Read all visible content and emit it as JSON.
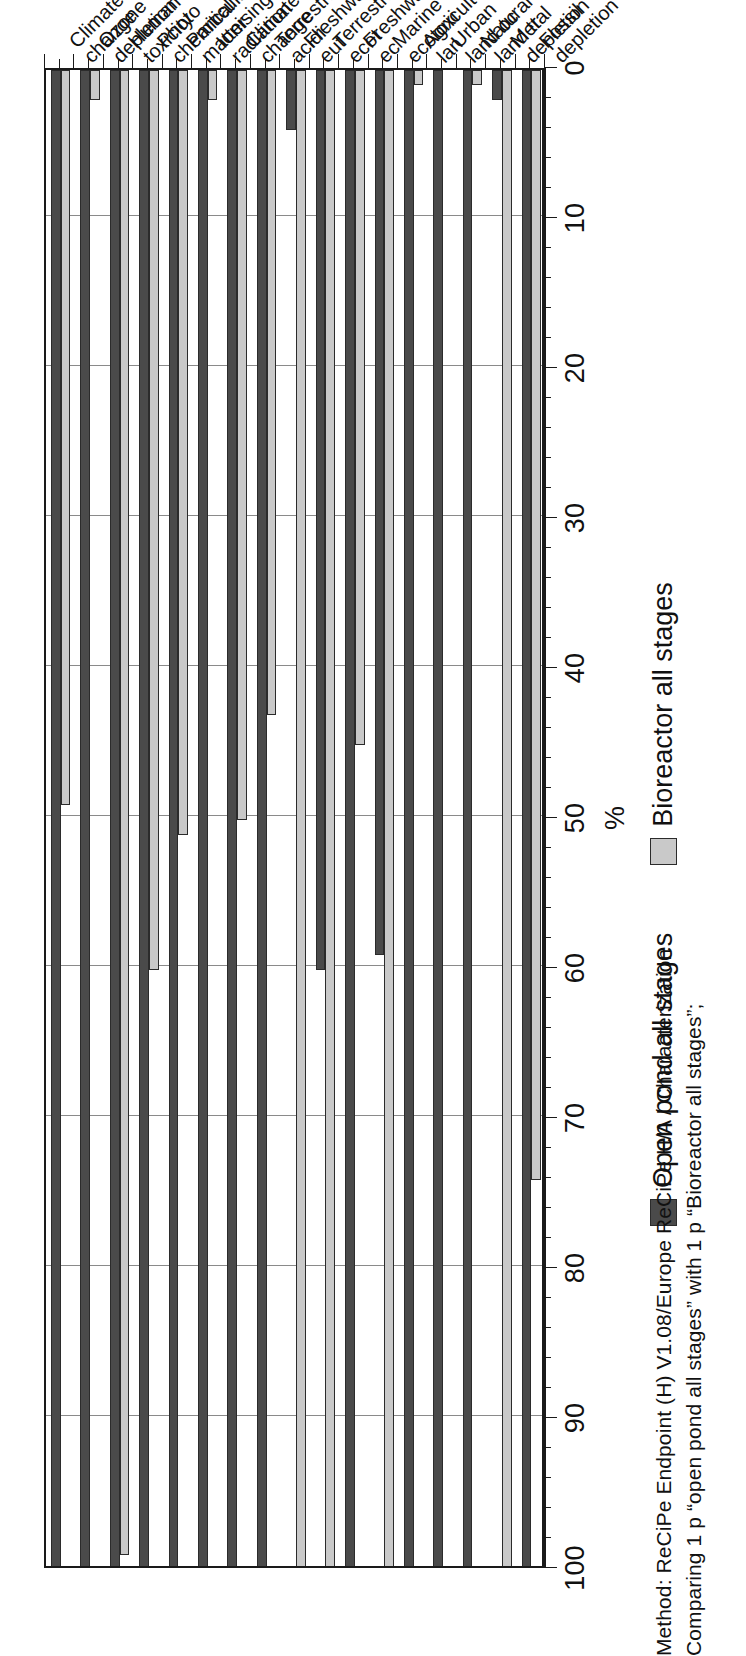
{
  "chart_data": {
    "type": "bar",
    "orientation": "horizontal-rotated",
    "title": "",
    "xlabel": "",
    "ylabel": "%",
    "value_axis_label": "%",
    "ylim": [
      0,
      100
    ],
    "axis_direction": "100-at-left-to-0-at-right",
    "grid": true,
    "legend_position": "bottom-center",
    "tick_values": [
      100,
      90,
      80,
      70,
      60,
      50,
      40,
      30,
      20,
      10,
      0
    ],
    "tick_labels": [
      "100",
      "90",
      "80",
      "70",
      "60",
      "50",
      "40",
      "30",
      "20",
      "10",
      "0"
    ],
    "minor_ticks_per_interval": 5,
    "categories": [
      {
        "line1": "Climate",
        "line2": "change"
      },
      {
        "line1": "Ozone",
        "line2": "depletion"
      },
      {
        "line1": "Human",
        "line2": "toxicity"
      },
      {
        "line1": "Photo",
        "line2": "chemical"
      },
      {
        "line1": "Particulate",
        "line2": "matter"
      },
      {
        "line1": "Ionising",
        "line2": "radiation"
      },
      {
        "line1": "Climate",
        "line2": "change"
      },
      {
        "line1": "Terrestrial",
        "line2": "acidi"
      },
      {
        "line1": "Freshwater",
        "line2": "eut"
      },
      {
        "line1": "Terrestrial",
        "line2": "ecot"
      },
      {
        "line1": "Freshwater",
        "line2": "ec"
      },
      {
        "line1": "Marine",
        "line2": "ecotoxi"
      },
      {
        "line1": "Agricultural",
        "line2": "lan"
      },
      {
        "line1": "Urban",
        "line2": "land oc"
      },
      {
        "line1": "Natural",
        "line2": "land tr"
      },
      {
        "line1": "Metal",
        "line2": "depletion"
      },
      {
        "line1": "Fossil",
        "line2": "depletion"
      }
    ],
    "series": [
      {
        "name": "Open pond all stages",
        "color": "#4a4a4a",
        "values": [
          100,
          100,
          100,
          100,
          100,
          100,
          100,
          100,
          4,
          60,
          100,
          59,
          100,
          100,
          100,
          2,
          100
        ]
      },
      {
        "name": "Bioreactor all stages",
        "color": "#c9c9c9",
        "values": [
          49,
          2,
          99,
          60,
          51,
          2,
          50,
          43,
          100,
          100,
          45,
          100,
          1,
          0,
          1,
          100,
          74
        ]
      }
    ]
  },
  "legend": {
    "items": [
      {
        "label": "Open pond all stages",
        "swatch_class": "series-open"
      },
      {
        "label": "Bioreactor all stages",
        "swatch_class": "series-bio"
      }
    ]
  },
  "caption": {
    "line1": "Method: ReCiPe Endpoint (H) V1.08/Europe ReCiPe H/A / Characterization",
    "line2": "Comparing 1 p “open pond all stages” with 1 p “Bioreactor all stages”;"
  },
  "colors": {
    "series_open": "#4a4a4a",
    "series_bio": "#c9c9c9",
    "axis": "#1a1a1a",
    "grid": "#8a8a8a",
    "background": "#ffffff"
  }
}
